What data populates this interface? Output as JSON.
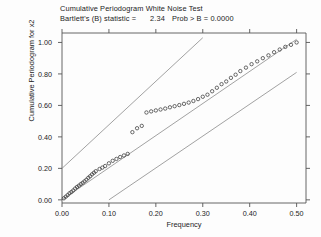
{
  "chart_data": {
    "type": "scatter",
    "title": "Cumulative Periodogram White Noise Test",
    "subtitle_prefix": "Bartlett's (B) statistic =",
    "subtitle_stat": "2.34",
    "subtitle_prob_label": "Prob > B =",
    "subtitle_prob_value": "0.0000",
    "xlabel": "Frequency",
    "ylabel": "Cumulative Periodogram for x2",
    "xlim": [
      0.0,
      0.52
    ],
    "ylim": [
      -0.02,
      1.06
    ],
    "xticks": [
      "0.00",
      "0.10",
      "0.20",
      "0.30",
      "0.40",
      "0.50"
    ],
    "xtick_values": [
      0.0,
      0.1,
      0.2,
      0.3,
      0.4,
      0.5
    ],
    "yticks": [
      "0.00",
      "0.20",
      "0.40",
      "0.60",
      "0.80",
      "1.00"
    ],
    "ytick_values": [
      0.0,
      0.2,
      0.4,
      0.6,
      0.8,
      1.0
    ],
    "grid": false,
    "legend": "none",
    "marker": "open-circle",
    "series": [
      {
        "name": "cumulative periodogram",
        "x": [
          0.004,
          0.008,
          0.012,
          0.016,
          0.02,
          0.024,
          0.028,
          0.032,
          0.036,
          0.04,
          0.044,
          0.048,
          0.052,
          0.056,
          0.06,
          0.064,
          0.068,
          0.072,
          0.08,
          0.086,
          0.092,
          0.1,
          0.108,
          0.116,
          0.124,
          0.132,
          0.14,
          0.15,
          0.16,
          0.17,
          0.18,
          0.19,
          0.2,
          0.21,
          0.22,
          0.23,
          0.24,
          0.25,
          0.26,
          0.27,
          0.28,
          0.29,
          0.3,
          0.31,
          0.32,
          0.33,
          0.34,
          0.35,
          0.36,
          0.37,
          0.38,
          0.392,
          0.404,
          0.416,
          0.428,
          0.44,
          0.452,
          0.464,
          0.476,
          0.488,
          0.5
        ],
        "y": [
          0.01,
          0.02,
          0.03,
          0.042,
          0.05,
          0.06,
          0.072,
          0.082,
          0.09,
          0.1,
          0.108,
          0.118,
          0.128,
          0.14,
          0.15,
          0.162,
          0.172,
          0.182,
          0.196,
          0.205,
          0.215,
          0.232,
          0.248,
          0.26,
          0.272,
          0.282,
          0.292,
          0.43,
          0.455,
          0.47,
          0.555,
          0.562,
          0.568,
          0.574,
          0.58,
          0.588,
          0.595,
          0.602,
          0.61,
          0.618,
          0.628,
          0.64,
          0.655,
          0.668,
          0.69,
          0.712,
          0.735,
          0.752,
          0.775,
          0.795,
          0.818,
          0.84,
          0.862,
          0.88,
          0.9,
          0.918,
          0.938,
          0.955,
          0.972,
          0.985,
          1.0
        ]
      }
    ],
    "reference_lines": [
      {
        "name": "upper-confidence-band",
        "x0": 0.0,
        "y0": 0.2,
        "x1": 0.3,
        "y1": 1.03
      },
      {
        "name": "45-degree-line",
        "x0": 0.0,
        "y0": 0.0,
        "x1": 0.5,
        "y1": 1.02
      },
      {
        "name": "lower-confidence-band",
        "x0": 0.1,
        "y0": 0.0,
        "x1": 0.5,
        "y1": 0.81
      }
    ]
  }
}
